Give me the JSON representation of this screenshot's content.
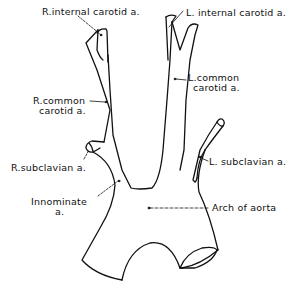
{
  "figure": {
    "line_color": "#111111",
    "background": "#ffffff",
    "labels": {
      "r_internal_carotid": "R.internal carotid a.",
      "l_internal_carotid": "L. internal carotid a.",
      "l_common_carotid_line1": "L.common",
      "l_common_carotid_line2": "carotid a.",
      "r_common_carotid_line1": "R.common",
      "r_common_carotid_line2": "carotid a.",
      "r_subclavian": "R.subclavian a.",
      "l_subclavian": "L. subclavian a.",
      "innominate_line1": "Innominate",
      "innominate_line2": "a.",
      "arch_of_aorta": "Arch of aorta"
    }
  }
}
